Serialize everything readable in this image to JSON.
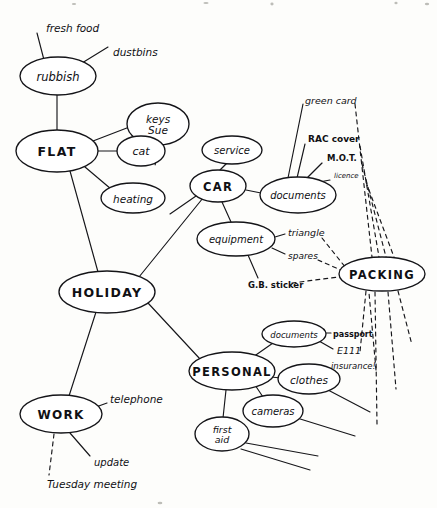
{
  "document": {
    "kind": "hand-drawn-mind-map",
    "title": "HOLIDAY mind map",
    "ink_color": "#16161a",
    "paper_color": "#fdfdfb"
  },
  "nodes": {
    "holiday": {
      "label": "HOLIDAY",
      "cx": 107,
      "cy": 292,
      "rx": 48,
      "ry": 21,
      "style": "major",
      "font_size": 12.5
    },
    "flat": {
      "label": "FLAT",
      "cx": 57,
      "cy": 151,
      "rx": 41,
      "ry": 21,
      "style": "major",
      "font_size": 12.5
    },
    "rubbish": {
      "label": "rubbish",
      "cx": 58,
      "cy": 76,
      "rx": 38,
      "ry": 19,
      "style": "minor",
      "font_size": 11.5
    },
    "keys_sue": {
      "label": "keys",
      "label2": "Sue",
      "cx": 158,
      "cy": 124,
      "rx": 31,
      "ry": 21,
      "style": "minor",
      "font_size": 10.5
    },
    "cat": {
      "label": "cat",
      "cx": 141,
      "cy": 151,
      "rx": 24,
      "ry": 15,
      "style": "minor",
      "font_size": 11
    },
    "heating": {
      "label": "heating",
      "cx": 133,
      "cy": 198,
      "rx": 32,
      "ry": 15,
      "style": "minor",
      "font_size": 10.5
    },
    "car": {
      "label": "CAR",
      "cx": 218,
      "cy": 186,
      "rx": 28,
      "ry": 16,
      "style": "major",
      "font_size": 11.5
    },
    "service": {
      "label": "service",
      "cx": 232,
      "cy": 150,
      "rx": 30,
      "ry": 14,
      "style": "minor",
      "font_size": 10
    },
    "car_documents": {
      "label": "documents",
      "cx": 298,
      "cy": 195,
      "rx": 38,
      "ry": 18,
      "style": "minor",
      "font_size": 10
    },
    "equipment": {
      "label": "equipment",
      "cx": 236,
      "cy": 239,
      "rx": 39,
      "ry": 17,
      "style": "minor",
      "font_size": 10
    },
    "packing": {
      "label": "PACKING",
      "cx": 382,
      "cy": 274,
      "rx": 43,
      "ry": 17,
      "style": "major",
      "font_size": 11.5
    },
    "personal": {
      "label": "PERSONAL",
      "cx": 232,
      "cy": 371,
      "rx": 43,
      "ry": 19,
      "style": "major",
      "font_size": 11.5
    },
    "pers_documents": {
      "label": "documents",
      "cx": 294,
      "cy": 334,
      "rx": 32,
      "ry": 13,
      "style": "minor",
      "font_size": 8.5
    },
    "clothes": {
      "label": "clothes",
      "cx": 309,
      "cy": 379,
      "rx": 31,
      "ry": 15,
      "style": "minor",
      "font_size": 10.5
    },
    "cameras": {
      "label": "cameras",
      "cx": 273,
      "cy": 411,
      "rx": 30,
      "ry": 16,
      "style": "minor",
      "font_size": 10
    },
    "first_aid": {
      "label": "first",
      "label2": "aid",
      "cx": 222,
      "cy": 434,
      "rx": 27,
      "ry": 17,
      "style": "minor",
      "font_size": 9.5
    },
    "work": {
      "label": "WORK",
      "cx": 61,
      "cy": 414,
      "rx": 41,
      "ry": 19,
      "style": "major",
      "font_size": 12
    }
  },
  "leaf_labels": {
    "fresh_food": {
      "text": "fresh food",
      "x": 46,
      "y": 28,
      "font_size": 10.5,
      "bold": false
    },
    "dustbins": {
      "text": "dustbins",
      "x": 113,
      "y": 52,
      "font_size": 10.5,
      "bold": false
    },
    "green_card": {
      "text": "green card",
      "x": 305,
      "y": 100,
      "font_size": 9.5,
      "bold": false
    },
    "rac_cover": {
      "text": "RAC cover",
      "x": 308,
      "y": 139,
      "font_size": 9,
      "bold": true
    },
    "mot": {
      "text": "M.O.T.",
      "x": 327,
      "y": 158,
      "font_size": 8.5,
      "bold": true
    },
    "licence": {
      "text": "licence",
      "x": 334,
      "y": 176,
      "font_size": 7,
      "bold": false
    },
    "triangle": {
      "text": "triangle",
      "x": 288,
      "y": 232,
      "font_size": 9.5,
      "bold": false
    },
    "spares": {
      "text": "spares",
      "x": 288,
      "y": 256,
      "font_size": 9,
      "bold": false
    },
    "gb_sticker": {
      "text": "G.B. sticker",
      "x": 248,
      "y": 285,
      "font_size": 8.5,
      "bold": true
    },
    "passport": {
      "text": "passport",
      "x": 333,
      "y": 334,
      "font_size": 8,
      "bold": true
    },
    "e111": {
      "text": "E111",
      "x": 337,
      "y": 350,
      "font_size": 9.5,
      "bold": false
    },
    "insurance": {
      "text": "insurance!",
      "x": 331,
      "y": 366,
      "font_size": 8.5,
      "bold": false
    },
    "telephone": {
      "text": "telephone",
      "x": 110,
      "y": 399,
      "font_size": 10.5,
      "bold": false
    },
    "update": {
      "text": "update",
      "x": 94,
      "y": 462,
      "font_size": 10,
      "bold": false
    },
    "tuesday_meeting": {
      "text": "Tuesday meeting",
      "x": 47,
      "y": 484,
      "font_size": 10.5,
      "bold": false
    }
  },
  "edges": {
    "solid": [
      {
        "name": "rubbish-to-fresh-food",
        "d": "M 44 60 L 37 33"
      },
      {
        "name": "rubbish-to-dustbins",
        "d": "M 82 63 L 108 47"
      },
      {
        "name": "rubbish-to-flat",
        "d": "M 57 95 L 57 131"
      },
      {
        "name": "flat-to-keys-sue",
        "d": "M 93 141 L 132 126"
      },
      {
        "name": "flat-to-cat",
        "d": "M 98 151 L 117 151"
      },
      {
        "name": "flat-to-heating",
        "d": "M 85 167 L 111 189"
      },
      {
        "name": "flat-to-holiday",
        "d": "M 70 171 L 98 272"
      },
      {
        "name": "holiday-to-car",
        "d": "M 139 277 L 203 198"
      },
      {
        "name": "car-to-service",
        "d": "M 220 170 L 226 164"
      },
      {
        "name": "car-to-car-documents",
        "d": "M 246 190 L 261 193"
      },
      {
        "name": "car-to-equipment",
        "d": "M 222 202 L 231 222"
      },
      {
        "name": "car-to-lower-left",
        "d": "M 196 196 L 170 214"
      },
      {
        "name": "cardocs-to-green-card",
        "d": "M 288 178 L 303 104"
      },
      {
        "name": "cardocs-to-rac-cover",
        "d": "M 297 178 L 305 144"
      },
      {
        "name": "cardocs-to-mot",
        "d": "M 306 179 L 322 163"
      },
      {
        "name": "cardocs-to-licence",
        "d": "M 314 183 L 330 180"
      },
      {
        "name": "equipment-to-triangle",
        "d": "M 275 237 L 285 234"
      },
      {
        "name": "equipment-to-spares",
        "d": "M 272 248 L 285 254"
      },
      {
        "name": "equipment-to-gb-sticker",
        "d": "M 248 255 L 258 278"
      },
      {
        "name": "holiday-to-personal",
        "d": "M 148 303 L 200 359"
      },
      {
        "name": "personal-to-pers-documents",
        "d": "M 253 357 L 273 343"
      },
      {
        "name": "personal-to-clothes",
        "d": "M 271 377 L 281 378"
      },
      {
        "name": "personal-to-cameras",
        "d": "M 255 385 L 263 397"
      },
      {
        "name": "personal-to-first-aid",
        "d": "M 226 390 L 223 418"
      },
      {
        "name": "persdocs-to-passport",
        "d": "M 324 333 L 331 333"
      },
      {
        "name": "persdocs-to-e111",
        "d": "M 319 341 L 333 349"
      },
      {
        "name": "clothes-to-blank-1",
        "d": "M 328 390 L 370 412"
      },
      {
        "name": "cameras-to-blank-1",
        "d": "M 297 418 L 355 436"
      },
      {
        "name": "firstaid-to-blank-1",
        "d": "M 246 443 L 318 456"
      },
      {
        "name": "firstaid-to-blank-2",
        "d": "M 241 449 L 310 470"
      },
      {
        "name": "holiday-to-work",
        "d": "M 96 312 L 69 396"
      },
      {
        "name": "work-to-telephone",
        "d": "M 96 407 L 107 403"
      },
      {
        "name": "work-to-update",
        "d": "M 70 433 L 90 456"
      }
    ],
    "dashed": [
      {
        "name": "keys-sue-to-cat",
        "d": "M 158 145 L 155 166"
      },
      {
        "name": "triangle-to-packing",
        "d": "M 322 238 L 346 268"
      },
      {
        "name": "spares-to-packing",
        "d": "M 318 260 L 343 271"
      },
      {
        "name": "gb-sticker-to-packing",
        "d": "M 292 283 L 338 277"
      },
      {
        "name": "green-card-to-packing",
        "d": "M 355 104 L 372 257"
      },
      {
        "name": "rac-cover-to-packing",
        "d": "M 360 146 L 379 257"
      },
      {
        "name": "mot-to-packing",
        "d": "M 362 164 L 386 257"
      },
      {
        "name": "licence-to-packing",
        "d": "M 366 182 L 394 257"
      },
      {
        "name": "insurance-to-packing",
        "d": "M 376 370 L 369 293"
      },
      {
        "name": "packing-down-1",
        "d": "M 366 291 L 360 352"
      },
      {
        "name": "packing-down-2",
        "d": "M 375 292 L 377 424"
      },
      {
        "name": "packing-down-3",
        "d": "M 388 292 L 396 389"
      },
      {
        "name": "packing-down-4",
        "d": "M 398 291 L 412 345"
      },
      {
        "name": "work-to-tuesday-meeting",
        "d": "M 54 434 L 49 475"
      }
    ]
  }
}
